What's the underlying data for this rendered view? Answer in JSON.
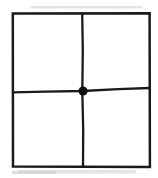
{
  "figure": {
    "title": "Square divided into four quadrants with marked center point",
    "type": "line-diagram",
    "background_color": "#ffffff",
    "stroke_color": "#1a1a1a",
    "smudge_color": "#d8d8d8",
    "canvas": {
      "width": 158,
      "height": 178
    },
    "square": {
      "name": "outer-square",
      "left": 12,
      "top": 13,
      "right": 150,
      "bottom": 167,
      "stroke_width": 2.4
    },
    "divider_vertical": {
      "name": "vertical-divider",
      "x_top": 82,
      "y_top": 13,
      "x_bottom": 83,
      "y_bottom": 167,
      "stroke_width": 2.2
    },
    "divider_horizontal": {
      "name": "horizontal-divider",
      "x_left": 12,
      "y_left": 92,
      "x_right": 150,
      "y_right": 88,
      "y_center": 91,
      "stroke_width": 2.2
    },
    "center_point": {
      "name": "center-dot",
      "cx": 83,
      "cy": 91,
      "radius": 4.6,
      "fill": "#111111",
      "label": ""
    },
    "quadrants": [
      {
        "name": "quadrant-top-left",
        "label": ""
      },
      {
        "name": "quadrant-top-right",
        "label": ""
      },
      {
        "name": "quadrant-bottom-left",
        "label": ""
      },
      {
        "name": "quadrant-bottom-right",
        "label": ""
      }
    ],
    "artifacts": [
      {
        "name": "scan-smudge-top",
        "x": 30,
        "y": 6,
        "width": 112,
        "height": 3
      },
      {
        "name": "scan-smudge-bottom",
        "x": 18,
        "y": 170,
        "width": 118,
        "height": 4
      }
    ]
  }
}
